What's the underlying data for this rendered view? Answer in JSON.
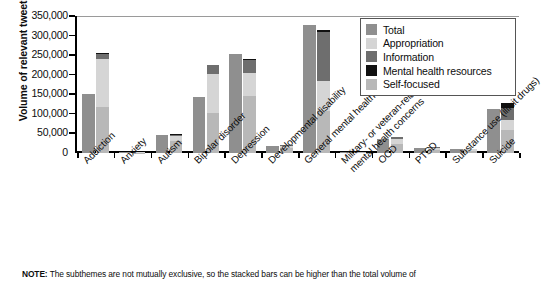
{
  "chart_data": {
    "type": "bar",
    "title": "",
    "xlabel": "",
    "ylabel": "Volume of relevant tweets",
    "ylim": [
      0,
      350000
    ],
    "yticks": [
      0,
      50000,
      100000,
      150000,
      200000,
      250000,
      300000,
      350000
    ],
    "ytick_labels": [
      "0",
      "50,000",
      "100,000",
      "150,000",
      "200,000",
      "250,000",
      "300,000",
      "350,000"
    ],
    "grid": false,
    "legend_position": "top-right",
    "legend": [
      "Total",
      "Appropriation",
      "Information",
      "Mental health resources",
      "Self-focused"
    ],
    "colors": {
      "total": "#8f8f8f",
      "appropriation": "#d5d5d5",
      "information": "#6e6e6e",
      "mental_health_resources": "#111111",
      "self_focused": "#b8b8b8"
    },
    "categories": [
      "Addiction",
      "Anxiety",
      "Autism",
      "Bipolar disorder",
      "Depression",
      "Developmental disability",
      "General mental health",
      "Military- or veteran-related\nmental health concerns",
      "OCD",
      "PTSD",
      "Substance use (illicit drugs)",
      "Suicide"
    ],
    "series": [
      {
        "name": "Total",
        "values": [
          150000,
          2000,
          45000,
          143000,
          252000,
          18000,
          328000,
          3000,
          35000,
          14000,
          11000,
          113000
        ]
      },
      {
        "name": "Self-focused",
        "values": [
          118000,
          1200,
          30000,
          102000,
          145000,
          13000,
          108000,
          1500,
          22000,
          8000,
          6000,
          58000
        ]
      },
      {
        "name": "Appropriation",
        "values": [
          122000,
          600,
          13000,
          100000,
          60000,
          5000,
          75000,
          900,
          14000,
          4500,
          3500,
          26000
        ]
      },
      {
        "name": "Information",
        "values": [
          14000,
          300,
          4000,
          22000,
          33000,
          2500,
          126000,
          700,
          4000,
          2500,
          1800,
          31000
        ]
      },
      {
        "name": "Mental health resources",
        "values": [
          1000,
          100,
          1000,
          1000,
          2000,
          500,
          6000,
          200,
          500,
          300,
          200,
          13000
        ]
      },
      {
        "name": "StackedTotal",
        "values": [
          255000,
          2200,
          48000,
          225000,
          240000,
          21000,
          315000,
          3300,
          40500,
          15300,
          11500,
          128000
        ]
      }
    ]
  },
  "note": {
    "prefix": "NOTE:",
    "text": "The subthemes are not mutually exclusive, so the stacked bars can be higher than the total volume of"
  }
}
